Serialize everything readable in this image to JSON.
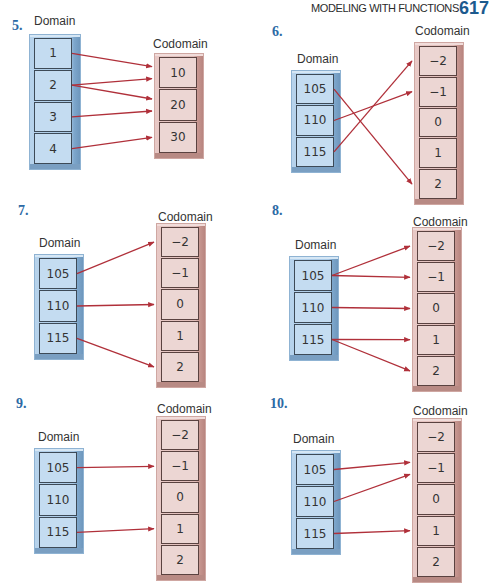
{
  "header": {
    "title": "MODELING WITH FUNCTIONS",
    "page_number": "617"
  },
  "colors": {
    "arrow": "#b0303a",
    "exercise_number": "#2c6aa5",
    "page_number": "#1c5a8e",
    "domain_fill": "#c4dcf1",
    "codomain_fill": "#ecd6d3"
  },
  "labels": {
    "domain": "Domain",
    "codomain": "Codomain"
  },
  "diagrams": [
    {
      "number": "5.",
      "domain": [
        "1",
        "2",
        "3",
        "4"
      ],
      "codomain": [
        "10",
        "20",
        "30"
      ],
      "mappings": [
        [
          "1",
          "10"
        ],
        [
          "2",
          "10"
        ],
        [
          "2",
          "20"
        ],
        [
          "3",
          "20"
        ],
        [
          "4",
          "30"
        ]
      ]
    },
    {
      "number": "6.",
      "domain": [
        "105",
        "110",
        "115"
      ],
      "codomain": [
        "−2",
        "−1",
        "0",
        "1",
        "2"
      ],
      "mappings": [
        [
          "105",
          "2"
        ],
        [
          "110",
          "−1"
        ],
        [
          "115",
          "−2"
        ]
      ]
    },
    {
      "number": "7.",
      "domain": [
        "105",
        "110",
        "115"
      ],
      "codomain": [
        "−2",
        "−1",
        "0",
        "1",
        "2"
      ],
      "mappings": [
        [
          "105",
          "−2"
        ],
        [
          "110",
          "0"
        ],
        [
          "115",
          "2"
        ]
      ]
    },
    {
      "number": "8.",
      "domain": [
        "105",
        "110",
        "115"
      ],
      "codomain": [
        "−2",
        "−1",
        "0",
        "1",
        "2"
      ],
      "mappings": [
        [
          "105",
          "−2"
        ],
        [
          "105",
          "−1"
        ],
        [
          "110",
          "0"
        ],
        [
          "115",
          "1"
        ],
        [
          "115",
          "2"
        ]
      ]
    },
    {
      "number": "9.",
      "domain": [
        "105",
        "110",
        "115"
      ],
      "codomain": [
        "−2",
        "−1",
        "0",
        "1",
        "2"
      ],
      "mappings": [
        [
          "105",
          "−1"
        ],
        [
          "115",
          "1"
        ]
      ]
    },
    {
      "number": "10.",
      "domain": [
        "105",
        "110",
        "115"
      ],
      "codomain": [
        "−2",
        "−1",
        "0",
        "1",
        "2"
      ],
      "mappings": [
        [
          "105",
          "−1"
        ],
        [
          "110",
          "−1"
        ],
        [
          "115",
          "1"
        ]
      ]
    }
  ]
}
